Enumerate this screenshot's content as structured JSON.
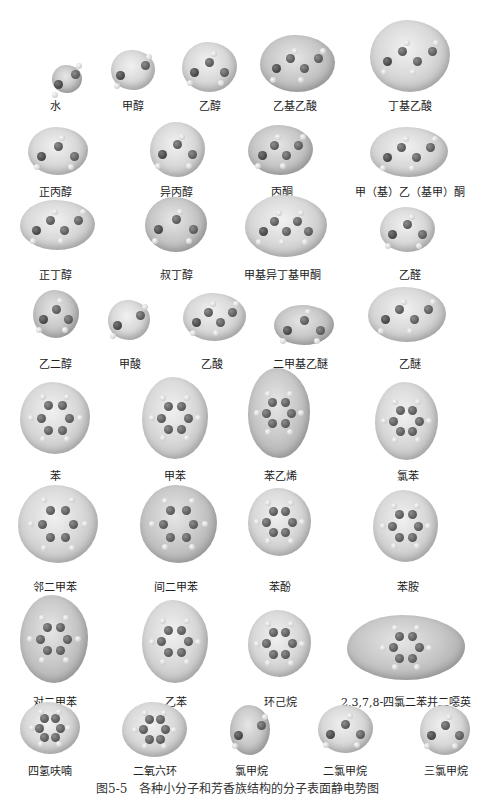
{
  "figure": {
    "caption_partial": "图5-5　各种小分子和芳香族结构的分子表面静电势图",
    "rows": [
      [
        {
          "label": "水",
          "x": 52,
          "y": 65,
          "w": 30,
          "h": 28,
          "cx": 55,
          "ly": 97
        },
        {
          "label": "甲醇",
          "x": 111,
          "y": 50,
          "w": 44,
          "h": 40,
          "cx": 133,
          "ly": 97
        },
        {
          "label": "乙醇",
          "x": 182,
          "y": 42,
          "w": 55,
          "h": 50,
          "cx": 210,
          "ly": 97
        },
        {
          "label": "乙基乙酸",
          "x": 260,
          "y": 35,
          "w": 75,
          "h": 57,
          "cx": 295,
          "ly": 97
        },
        {
          "label": "丁基乙酸",
          "x": 370,
          "y": 20,
          "w": 80,
          "h": 72,
          "cx": 410,
          "ly": 97
        }
      ],
      [
        {
          "label": "正丙醇",
          "x": 28,
          "y": 127,
          "w": 60,
          "h": 48,
          "cx": 55,
          "ly": 183
        },
        {
          "label": "异丙醇",
          "x": 150,
          "y": 122,
          "w": 55,
          "h": 55,
          "cx": 176,
          "ly": 183
        },
        {
          "label": "丙酮",
          "x": 248,
          "y": 125,
          "w": 65,
          "h": 50,
          "cx": 282,
          "ly": 183
        },
        {
          "label": "甲（基）乙（基甲）酮",
          "x": 370,
          "y": 127,
          "w": 78,
          "h": 50,
          "cx": 410,
          "ly": 183
        }
      ],
      [
        {
          "label": "正丁醇",
          "x": 20,
          "y": 200,
          "w": 75,
          "h": 50,
          "cx": 55,
          "ly": 266
        },
        {
          "label": "叔丁醇",
          "x": 145,
          "y": 197,
          "w": 62,
          "h": 55,
          "cx": 176,
          "ly": 266
        },
        {
          "label": "甲基异丁基甲酮",
          "x": 245,
          "y": 195,
          "w": 82,
          "h": 62,
          "cx": 282,
          "ly": 266
        },
        {
          "label": "乙醛",
          "x": 380,
          "y": 207,
          "w": 55,
          "h": 45,
          "cx": 410,
          "ly": 266
        }
      ],
      [
        {
          "label": "乙二醇",
          "x": 33,
          "y": 290,
          "w": 46,
          "h": 48,
          "cx": 55,
          "ly": 355
        },
        {
          "label": "甲酸",
          "x": 108,
          "y": 300,
          "w": 42,
          "h": 40,
          "cx": 130,
          "ly": 355
        },
        {
          "label": "乙酸",
          "x": 183,
          "y": 293,
          "w": 63,
          "h": 48,
          "cx": 212,
          "ly": 355
        },
        {
          "label": "二甲基乙醚",
          "x": 274,
          "y": 305,
          "w": 60,
          "h": 40,
          "cx": 300,
          "ly": 355
        },
        {
          "label": "乙醚",
          "x": 368,
          "y": 287,
          "w": 78,
          "h": 55,
          "cx": 410,
          "ly": 355
        }
      ],
      [
        {
          "label": "苯",
          "x": 20,
          "y": 382,
          "w": 70,
          "h": 72,
          "cx": 55,
          "ly": 467,
          "ring": true
        },
        {
          "label": "甲苯",
          "x": 142,
          "y": 377,
          "w": 66,
          "h": 82,
          "cx": 175,
          "ly": 467,
          "ring": true
        },
        {
          "label": "苯乙烯",
          "x": 248,
          "y": 368,
          "w": 62,
          "h": 90,
          "cx": 280,
          "ly": 467,
          "ring": true
        },
        {
          "label": "氯苯",
          "x": 375,
          "y": 382,
          "w": 63,
          "h": 78,
          "cx": 408,
          "ly": 467,
          "ring": true
        }
      ],
      [
        {
          "label": "邻二甲苯",
          "x": 18,
          "y": 485,
          "w": 80,
          "h": 78,
          "cx": 55,
          "ly": 578,
          "ring": true
        },
        {
          "label": "间二甲苯",
          "x": 140,
          "y": 485,
          "w": 77,
          "h": 78,
          "cx": 176,
          "ly": 578,
          "ring": true
        },
        {
          "label": "苯酚",
          "x": 248,
          "y": 488,
          "w": 63,
          "h": 68,
          "cx": 280,
          "ly": 578,
          "ring": true
        },
        {
          "label": "苯胺",
          "x": 373,
          "y": 490,
          "w": 65,
          "h": 72,
          "cx": 408,
          "ly": 578,
          "ring": true
        }
      ],
      [
        {
          "label": "对二甲苯",
          "x": 20,
          "y": 595,
          "w": 68,
          "h": 88,
          "cx": 55,
          "ly": 693,
          "ring": true
        },
        {
          "label": "乙苯",
          "x": 142,
          "y": 600,
          "w": 66,
          "h": 83,
          "cx": 176,
          "ly": 693,
          "ring": true
        },
        {
          "label": "环己烷",
          "x": 248,
          "y": 610,
          "w": 63,
          "h": 67,
          "cx": 280,
          "ly": 693,
          "ring": true
        },
        {
          "label": "2,3,7,8-四氯二苯并二噁英",
          "x": 347,
          "y": 615,
          "w": 118,
          "h": 65,
          "cx": 406,
          "ly": 693,
          "ring": true
        }
      ],
      [
        {
          "label": "四氢呋喃",
          "x": 20,
          "y": 702,
          "w": 60,
          "h": 52,
          "cx": 50,
          "ly": 762,
          "ring": true
        },
        {
          "label": "二氧六环",
          "x": 122,
          "y": 702,
          "w": 65,
          "h": 55,
          "cx": 155,
          "ly": 762,
          "ring": true
        },
        {
          "label": "氯甲烷",
          "x": 230,
          "y": 705,
          "w": 40,
          "h": 50,
          "cx": 251,
          "ly": 762
        },
        {
          "label": "二氯甲烷",
          "x": 318,
          "y": 705,
          "w": 55,
          "h": 48,
          "cx": 345,
          "ly": 762
        },
        {
          "label": "三氯甲烷",
          "x": 420,
          "y": 705,
          "w": 50,
          "h": 50,
          "cx": 446,
          "ly": 762
        }
      ]
    ]
  }
}
